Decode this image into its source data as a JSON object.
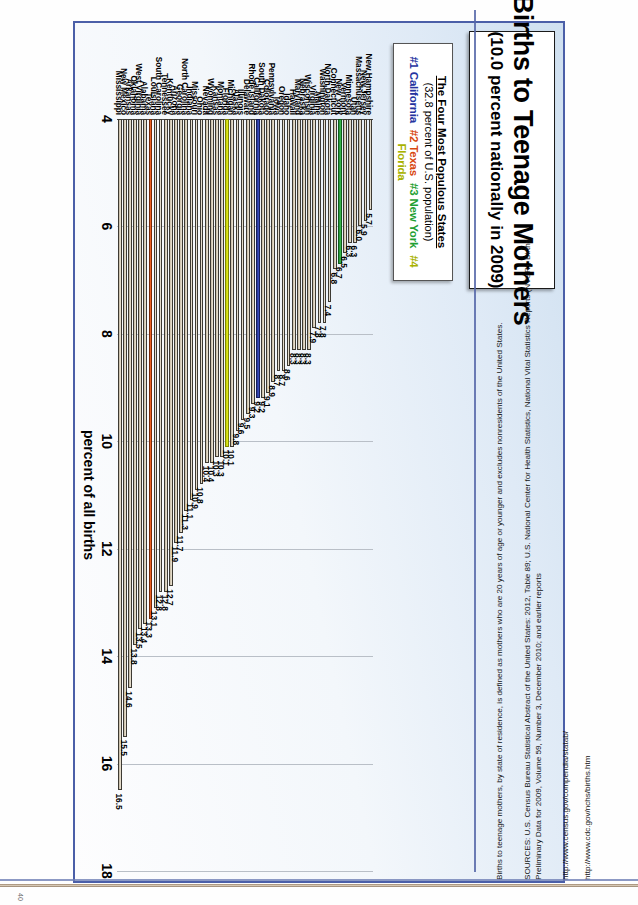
{
  "slide": {
    "title_main": "Births to Teenage Mothers",
    "title_sub": "(10.0 percent nationally in 2009)",
    "legend": {
      "heading": "The Four Most Populous States",
      "population_note": "(32.8 percent of U.S. population)",
      "entries": [
        {
          "rank": "#1",
          "state": "California",
          "color": "#2433a0"
        },
        {
          "rank": "#2",
          "state": "Texas",
          "color": "#d8470f"
        },
        {
          "rank": "#3",
          "state": "New York",
          "color": "#1f9f33"
        },
        {
          "rank": "#4",
          "state": "Florida",
          "color": "#a8b200"
        }
      ]
    }
  },
  "notes": {
    "definition": "Births to teenage mothers, by state of residence, is defined as mothers who are 20 years of age or younger and excludes nonresidents of the United States.",
    "sources_line1": "SOURCES: U.S. Census Bureau Statistical Abstract of the United States: 2012, Table 89; U.S. National Center for Health Statistics, National Vital Statistics Reports (NVSR), Births:",
    "sources_line2": "Preliminary Data for 2009, Volume 59, Number 3, December 2010; and earlier reports",
    "url_census": "http://www.census.gov/compendia/statab/",
    "url_cdc": "http://www.cdc.gov/nchs/births.htm",
    "page_number": "40"
  },
  "chart_data": {
    "type": "bar",
    "orientation": "horizontal",
    "title": "Births to Teenage Mothers",
    "subtitle": "(10.0 percent nationally in 2009)",
    "xlabel": "percent of all births",
    "ylabel": "",
    "xlim": [
      4,
      18
    ],
    "xticks": [
      4,
      6,
      8,
      10,
      12,
      14,
      16,
      18
    ],
    "grid": true,
    "legend_position": "top-left",
    "national_average": 10.0,
    "highlight_colors": {
      "California": "#2433a0",
      "Texas": "#d8470f",
      "New York": "#1f9f33",
      "Florida": "#c8d200",
      "other": "#cfc4ad"
    },
    "categories": [
      "Mississippi",
      "New Mexico",
      "Arkansas",
      "Oklahoma",
      "West Virginia",
      "Alabama",
      "Texas",
      "Louisiana",
      "South Carolina",
      "Tennessee",
      "Kentucky",
      "Arizona",
      "Georgia",
      "North Carolina",
      "Indiana",
      "Missouri",
      "Ohio",
      "Nevada",
      "Wyoming",
      "Kansas",
      "Montana",
      "Florida",
      "Michigan",
      "Alaska",
      "Illinois",
      "Delaware",
      "Rhode Island",
      "California",
      "South Dakota",
      "Colorado",
      "Pennsylvania",
      "Iowa",
      "Oregon",
      "Idaho",
      "Hawaii",
      "Maryland",
      "Nebraska",
      "Wisconsin",
      "Virginia",
      "Maine",
      "Washington",
      "North Dakota",
      "Connecticut",
      "New York",
      "Vermont",
      "Minnesota",
      "Utah",
      "Massachusetts",
      "New Jersey",
      "New Hampshire"
    ],
    "values": [
      16.5,
      15.5,
      14.6,
      13.8,
      13.5,
      13.4,
      13.3,
      13.1,
      12.8,
      12.8,
      12.7,
      11.9,
      11.7,
      11.3,
      11.1,
      10.9,
      10.8,
      10.4,
      10.4,
      10.3,
      10.3,
      10.1,
      10.1,
      9.8,
      9.6,
      9.5,
      9.3,
      9.2,
      9.2,
      9.1,
      8.9,
      8.7,
      8.7,
      8.6,
      8.3,
      8.3,
      8.3,
      8.3,
      7.9,
      7.8,
      7.8,
      7.4,
      6.8,
      6.7,
      6.5,
      6.3,
      6.3,
      6.0,
      5.9,
      5.7
    ],
    "value_labels": [
      "16.5",
      "15.5",
      "14.6",
      "13.8",
      "13.5",
      "13.4",
      "13.3",
      "13.1",
      "12.8",
      "12.8",
      "12.7",
      "11.9",
      "11.7",
      "11.3",
      "11.1",
      "10.9",
      "10.8",
      "10.4",
      "10.4",
      "10.3",
      "10.3",
      "10.1",
      "10.1",
      "9.8",
      "9.6",
      "9.5",
      "9.3",
      "9.2",
      "9.2",
      "9.1",
      "8.9",
      "8.7",
      "8.7",
      "8.6",
      "8.3",
      "8.3",
      "8.3",
      "8.3",
      "7.9",
      "7.8",
      "7.8",
      "7.4",
      "6.8",
      "6.7",
      "6.5",
      "6.3",
      "6.3",
      "6.0",
      "5.9",
      "5.7"
    ]
  }
}
